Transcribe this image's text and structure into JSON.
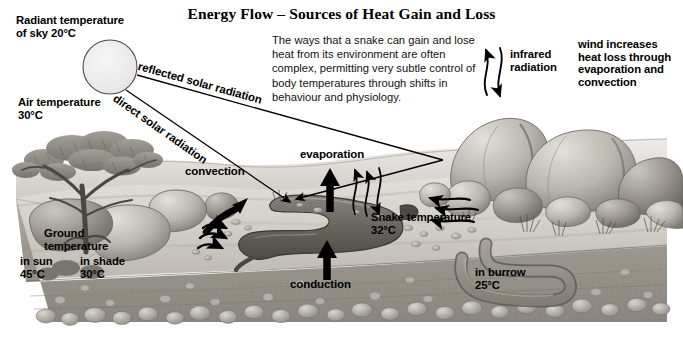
{
  "title": "Energy Flow – Sources of Heat Gain and Loss",
  "blurb": "The ways that a snake can gain and lose heat from its environment are often complex, permitting very subtle control of body temperatures through shifts in behaviour and physiology.",
  "labels": {
    "radiant_sky": "Radiant temperature\nof sky 20°C",
    "air_temp": "Air temperature\n30°C",
    "reflected_solar": "reflected solar radiation",
    "direct_solar": "direct solar radiation",
    "infrared": "infrared\nradiation",
    "wind": "wind increases\nheat loss through\nevaporation and\nconvection",
    "convection": "convection",
    "evaporation": "evaporation",
    "conduction": "conduction",
    "snake_temp": "Snake temperature\n32°C",
    "ground_temp": "Ground\ntemperature",
    "in_sun": "in sun\n45°C",
    "in_shade": "in shade\n30°C",
    "in_burrow": "in burrow\n25°C"
  },
  "temperatures": [
    {
      "name": "radiant sky",
      "value": 20,
      "unit": "°C"
    },
    {
      "name": "air",
      "value": 30,
      "unit": "°C"
    },
    {
      "name": "ground in sun",
      "value": 45,
      "unit": "°C"
    },
    {
      "name": "ground in shade",
      "value": 30,
      "unit": "°C"
    },
    {
      "name": "snake",
      "value": 32,
      "unit": "°C"
    },
    {
      "name": "burrow",
      "value": 25,
      "unit": "°C"
    }
  ],
  "icons": {
    "sun": "sun-icon",
    "tree": "acacia-tree-icon",
    "snake": "snake-icon",
    "boulders": "boulders-icon",
    "burrow": "burrow-icon",
    "arrow_convection": "curved-arrow-icon",
    "arrow_evaporation": "up-arrow-icon",
    "arrow_conduction": "up-arrow-icon",
    "arrow_infrared": "wavy-arrow-icon",
    "arrow_solar": "straight-arrow-icon"
  },
  "colors": {
    "background": "#ffffff",
    "ink": "#000000",
    "sun_fill": "#ececec",
    "sky_ground_light": "#e9e7e4",
    "ground_mid": "#b9b5b0",
    "ground_dark": "#8d8984",
    "soil": "#9c9892",
    "rock_light": "#d6d3ce",
    "rock_dark": "#7d7a75"
  }
}
